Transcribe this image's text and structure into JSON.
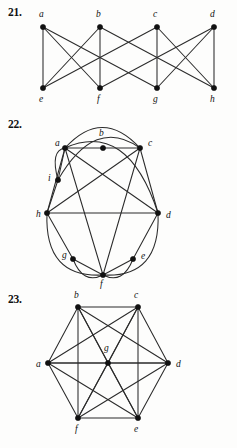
{
  "page": {
    "kind": "textbook-exercise-figures",
    "background_color": "#fdfdfc",
    "ink_color": "#2b2b2b"
  },
  "problems": [
    {
      "number": "21.",
      "name": "problem-21",
      "graph": {
        "type": "graph-diagram",
        "layout": "two-row-bipartite-like",
        "vertices": [
          {
            "id": "a",
            "label": "a",
            "x": 43,
            "y": 27,
            "label_x": 39,
            "label_y": 17
          },
          {
            "id": "b",
            "label": "b",
            "x": 100,
            "y": 27,
            "label_x": 96,
            "label_y": 17
          },
          {
            "id": "c",
            "label": "c",
            "x": 157,
            "y": 27,
            "label_x": 153,
            "label_y": 17
          },
          {
            "id": "d",
            "label": "d",
            "x": 214,
            "y": 27,
            "label_x": 210,
            "label_y": 17
          },
          {
            "id": "e",
            "label": "e",
            "x": 43,
            "y": 88,
            "label_x": 39,
            "label_y": 102
          },
          {
            "id": "f",
            "label": "f",
            "x": 100,
            "y": 88,
            "label_x": 97,
            "label_y": 102
          },
          {
            "id": "g",
            "label": "g",
            "x": 157,
            "y": 88,
            "label_x": 153,
            "label_y": 102
          },
          {
            "id": "h",
            "label": "h",
            "x": 214,
            "y": 88,
            "label_x": 210,
            "label_y": 102
          }
        ],
        "edges": [
          [
            "a",
            "e"
          ],
          [
            "b",
            "f"
          ],
          [
            "c",
            "g"
          ],
          [
            "d",
            "h"
          ],
          [
            "a",
            "f"
          ],
          [
            "b",
            "e"
          ],
          [
            "c",
            "h"
          ],
          [
            "d",
            "g"
          ],
          [
            "a",
            "g"
          ],
          [
            "c",
            "e"
          ],
          [
            "b",
            "h"
          ],
          [
            "d",
            "f"
          ]
        ]
      }
    },
    {
      "number": "22.",
      "name": "problem-22",
      "graph": {
        "type": "graph-diagram",
        "layout": "circular-with-arcs",
        "vertices": [
          {
            "id": "a",
            "label": "a",
            "x": 65,
            "y": 36,
            "label_x": 55,
            "label_y": 34
          },
          {
            "id": "b",
            "label": "b",
            "x": 103,
            "y": 36,
            "label_x": 99,
            "label_y": 24
          },
          {
            "id": "c",
            "label": "c",
            "x": 140,
            "y": 36,
            "label_x": 148,
            "label_y": 34
          },
          {
            "id": "d",
            "label": "d",
            "x": 158,
            "y": 101,
            "label_x": 166,
            "label_y": 106
          },
          {
            "id": "e",
            "label": "e",
            "x": 133,
            "y": 147,
            "label_x": 141,
            "label_y": 147
          },
          {
            "id": "f",
            "label": "f",
            "x": 103,
            "y": 163,
            "label_x": 100,
            "label_y": 175
          },
          {
            "id": "g",
            "label": "g",
            "x": 73,
            "y": 147,
            "label_x": 62,
            "label_y": 146
          },
          {
            "id": "h",
            "label": "h",
            "x": 47,
            "y": 101,
            "label_x": 36,
            "label_y": 105
          },
          {
            "id": "i",
            "label": "i",
            "x": 58,
            "y": 68,
            "label_x": 48,
            "label_y": 69
          }
        ],
        "straight_edges": [
          [
            "a",
            "b"
          ],
          [
            "b",
            "c"
          ],
          [
            "h",
            "d"
          ],
          [
            "a",
            "i"
          ],
          [
            "i",
            "h"
          ],
          [
            "a",
            "h"
          ],
          [
            "a",
            "d"
          ],
          [
            "a",
            "f"
          ],
          [
            "c",
            "h"
          ],
          [
            "c",
            "d"
          ],
          [
            "c",
            "f"
          ],
          [
            "h",
            "g"
          ],
          [
            "g",
            "f"
          ],
          [
            "d",
            "e"
          ],
          [
            "e",
            "f"
          ]
        ],
        "arc_edges": [
          {
            "from": "a",
            "to": "c",
            "bulge": "up"
          },
          {
            "from": "a",
            "to": "i",
            "bulge": "left"
          },
          {
            "from": "i",
            "to": "c",
            "bulge": "up-right"
          },
          {
            "from": "a",
            "to": "d",
            "bulge": "outer-right"
          },
          {
            "from": "h",
            "to": "f",
            "bulge": "down-left"
          },
          {
            "from": "g",
            "to": "f",
            "bulge": "down"
          },
          {
            "from": "f",
            "to": "d",
            "bulge": "down-right"
          },
          {
            "from": "f",
            "to": "e",
            "bulge": "down"
          }
        ]
      }
    },
    {
      "number": "23.",
      "name": "problem-23",
      "graph": {
        "type": "graph-diagram",
        "layout": "hexagon-with-center",
        "vertices": [
          {
            "id": "a",
            "label": "a",
            "x": 48,
            "y": 76,
            "label_x": 36,
            "label_y": 80
          },
          {
            "id": "b",
            "label": "b",
            "x": 78,
            "y": 20,
            "label_x": 74,
            "label_y": 11
          },
          {
            "id": "c",
            "label": "c",
            "x": 138,
            "y": 20,
            "label_x": 134,
            "label_y": 11
          },
          {
            "id": "d",
            "label": "d",
            "x": 168,
            "y": 76,
            "label_x": 176,
            "label_y": 80
          },
          {
            "id": "e",
            "label": "e",
            "x": 138,
            "y": 131,
            "label_x": 134,
            "label_y": 145
          },
          {
            "id": "f",
            "label": "f",
            "x": 78,
            "y": 131,
            "label_x": 75,
            "label_y": 145
          },
          {
            "id": "g",
            "label": "g",
            "x": 108,
            "y": 76,
            "label_x": 104,
            "label_y": 64
          }
        ],
        "edges": [
          [
            "a",
            "b"
          ],
          [
            "b",
            "c"
          ],
          [
            "c",
            "d"
          ],
          [
            "d",
            "e"
          ],
          [
            "e",
            "f"
          ],
          [
            "f",
            "a"
          ],
          [
            "a",
            "c"
          ],
          [
            "a",
            "d"
          ],
          [
            "a",
            "e"
          ],
          [
            "b",
            "d"
          ],
          [
            "b",
            "e"
          ],
          [
            "b",
            "f"
          ],
          [
            "c",
            "e"
          ],
          [
            "c",
            "f"
          ],
          [
            "d",
            "f"
          ],
          [
            "g",
            "a"
          ],
          [
            "g",
            "b"
          ],
          [
            "g",
            "c"
          ],
          [
            "g",
            "d"
          ],
          [
            "g",
            "e"
          ],
          [
            "g",
            "f"
          ]
        ]
      }
    }
  ]
}
